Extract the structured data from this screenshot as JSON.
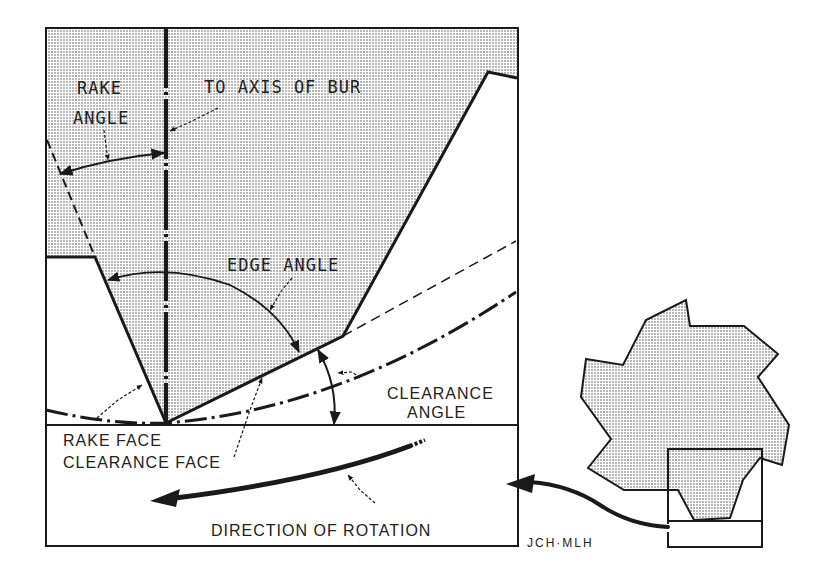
{
  "diagram": {
    "labels": {
      "rake_angle_line1": "RAKE",
      "rake_angle_line2": "ANGLE",
      "axis_of_bur": "TO AXIS OF BUR",
      "edge_angle": "EDGE ANGLE",
      "clearance_angle_line1": "CLEARANCE",
      "clearance_angle_line2": "ANGLE",
      "rake_face": "RAKE FACE",
      "clearance_face": "CLEARANCE FACE",
      "direction_of_rotation": "DIRECTION OF ROTATION"
    },
    "signature": "JCH·MLH",
    "colors": {
      "ink": "#1a1a1a",
      "shading": "#d9d9d9",
      "background": "#ffffff"
    },
    "inset": {
      "description": "Bur cross-section overview with magnified region box",
      "blade_count": 6
    }
  }
}
